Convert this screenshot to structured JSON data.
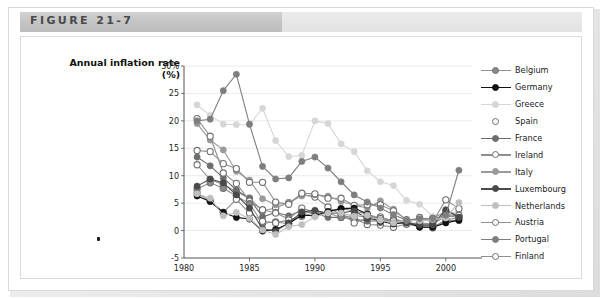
{
  "figure": {
    "label": "FIGURE 21-7"
  },
  "chart_data": {
    "type": "line",
    "title": "Annual inflation rate",
    "title_line2": "(%)",
    "xlabel": "",
    "ylabel": "Annual inflation rate (%)",
    "xlim": [
      1980,
      2002
    ],
    "ylim": [
      -5,
      30
    ],
    "grid": true,
    "legend_position": "right",
    "xticks": [
      "1980",
      "1985",
      "1990",
      "1995",
      "2000"
    ],
    "xtick_values": [
      1980,
      1985,
      1990,
      1995,
      2000
    ],
    "yticks": [
      "30%",
      "25",
      "20",
      "15",
      "10",
      "5",
      "0",
      "-5"
    ],
    "ytick_values": [
      30,
      25,
      20,
      15,
      10,
      5,
      0,
      -5
    ],
    "x": [
      1981,
      1982,
      1983,
      1984,
      1985,
      1986,
      1987,
      1988,
      1989,
      1990,
      1991,
      1992,
      1993,
      1994,
      1995,
      1996,
      1997,
      1998,
      1999,
      2000,
      2001
    ],
    "series": [
      {
        "name": "Belgium",
        "color": "#8a8a8a",
        "marker": "open",
        "values": [
          7.6,
          8.7,
          7.7,
          6.3,
          4.9,
          1.3,
          1.6,
          1.2,
          3.1,
          3.5,
          3.2,
          2.4,
          2.8,
          2.4,
          1.5,
          2.1,
          1.6,
          1.0,
          1.1,
          2.7,
          2.4
        ]
      },
      {
        "name": "Germany",
        "color": "#111111",
        "marker": "filled",
        "values": [
          6.3,
          5.3,
          3.3,
          2.4,
          2.1,
          -0.1,
          0.2,
          1.3,
          2.8,
          2.7,
          3.5,
          4.0,
          4.1,
          3.0,
          1.7,
          1.2,
          1.5,
          0.6,
          0.6,
          1.4,
          1.9
        ]
      },
      {
        "name": "Greece",
        "color": "#d6d6d6",
        "marker": "filled",
        "values": [
          22.9,
          21.0,
          19.4,
          19.3,
          19.3,
          22.3,
          16.4,
          13.5,
          13.7,
          20.0,
          19.5,
          15.8,
          14.4,
          10.9,
          8.9,
          8.2,
          5.5,
          4.8,
          2.6,
          3.2,
          3.4
        ]
      },
      {
        "name": "Spain",
        "color": "#ffffff",
        "marker": "open",
        "values": [
          14.6,
          14.4,
          12.2,
          11.3,
          8.8,
          8.8,
          5.2,
          4.8,
          6.8,
          6.7,
          5.9,
          5.9,
          4.6,
          4.7,
          4.7,
          3.6,
          2.0,
          1.8,
          2.2,
          3.5,
          2.8
        ]
      },
      {
        "name": "France",
        "color": "#6d6d6d",
        "marker": "filled",
        "values": [
          13.4,
          11.8,
          9.6,
          7.4,
          5.8,
          2.5,
          3.3,
          2.7,
          3.6,
          3.2,
          2.4,
          2.4,
          2.1,
          1.7,
          1.8,
          2.1,
          1.3,
          0.7,
          0.6,
          1.8,
          1.8
        ]
      },
      {
        "name": "Ireland",
        "color": "#ffffff",
        "marker": "open",
        "values": [
          20.4,
          17.2,
          10.5,
          8.6,
          5.4,
          3.8,
          3.2,
          2.1,
          4.1,
          3.3,
          3.2,
          3.1,
          1.4,
          2.3,
          2.5,
          1.7,
          1.4,
          2.4,
          1.6,
          5.6,
          4.0
        ]
      },
      {
        "name": "Italy",
        "color": "#9a9a9a",
        "marker": "filled",
        "values": [
          19.5,
          16.5,
          14.7,
          10.8,
          9.2,
          5.8,
          4.7,
          5.1,
          6.3,
          6.5,
          6.3,
          5.3,
          4.6,
          4.1,
          5.4,
          3.9,
          1.9,
          2.0,
          1.7,
          2.6,
          2.7
        ]
      },
      {
        "name": "Luxembourg",
        "color": "#4a4a4a",
        "marker": "filled",
        "values": [
          8.1,
          9.4,
          8.7,
          6.5,
          4.1,
          0.3,
          -0.1,
          1.4,
          3.4,
          3.7,
          3.1,
          3.2,
          3.6,
          2.2,
          1.9,
          1.4,
          1.4,
          1.0,
          1.0,
          3.8,
          2.4
        ]
      },
      {
        "name": "Netherlands",
        "color": "#bfbfbf",
        "marker": "filled",
        "values": [
          6.7,
          5.9,
          2.7,
          3.3,
          2.2,
          0.1,
          -0.7,
          0.7,
          1.1,
          2.5,
          3.2,
          3.2,
          2.6,
          2.8,
          1.9,
          1.4,
          1.9,
          1.8,
          2.0,
          2.3,
          5.1
        ]
      },
      {
        "name": "Austria",
        "color": "#ffffff",
        "marker": "open",
        "values": [
          6.8,
          5.4,
          3.3,
          5.7,
          3.2,
          1.7,
          1.4,
          1.9,
          2.6,
          3.3,
          3.3,
          4.0,
          3.6,
          3.0,
          2.2,
          1.8,
          1.2,
          0.8,
          0.5,
          2.0,
          2.3
        ]
      },
      {
        "name": "Portugal",
        "color": "#7e7e7e",
        "marker": "filled",
        "values": [
          20.0,
          20.3,
          25.5,
          28.5,
          19.4,
          11.7,
          9.4,
          9.6,
          12.6,
          13.4,
          11.4,
          8.9,
          6.5,
          5.2,
          4.1,
          2.9,
          1.9,
          2.2,
          2.2,
          2.8,
          11.0
        ]
      },
      {
        "name": "Finland",
        "color": "#ffffff",
        "marker": "open",
        "values": [
          12.0,
          9.3,
          8.4,
          7.1,
          5.9,
          3.6,
          4.1,
          5.1,
          6.6,
          6.1,
          4.3,
          2.9,
          2.2,
          1.1,
          1.0,
          0.6,
          1.2,
          1.4,
          1.2,
          3.0,
          2.6
        ]
      }
    ]
  }
}
